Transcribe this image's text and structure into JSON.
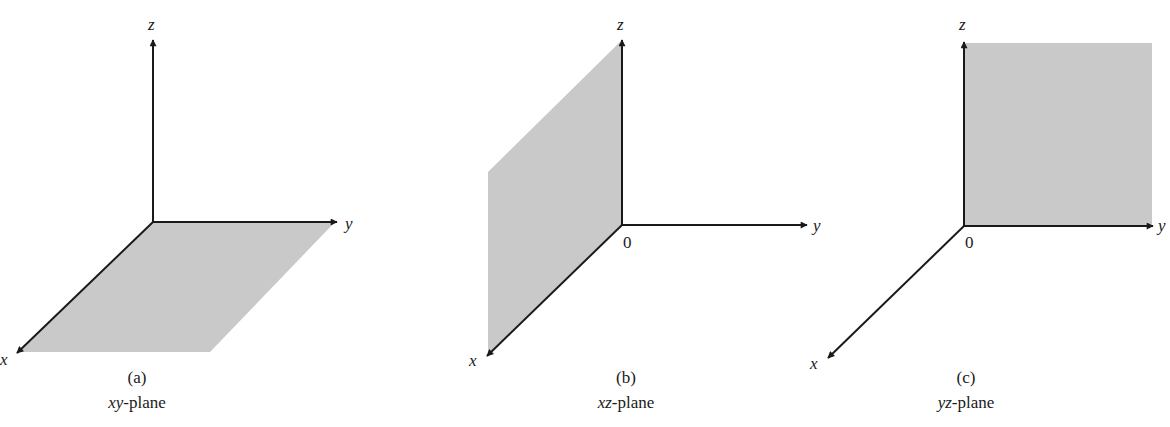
{
  "figure": {
    "colors": {
      "plane_fill": "#c9c9c9",
      "axis": "#1a1a1a",
      "background": "#ffffff"
    },
    "panels": [
      {
        "id": "a",
        "caption_letter": "(a)",
        "caption_var": "xy",
        "caption_suffix": "-plane",
        "axes": {
          "x": "x",
          "y": "y",
          "z": "z"
        },
        "origin_label": ""
      },
      {
        "id": "b",
        "caption_letter": "(b)",
        "caption_var": "xz",
        "caption_suffix": "-plane",
        "axes": {
          "x": "x",
          "y": "y",
          "z": "z"
        },
        "origin_label": "0"
      },
      {
        "id": "c",
        "caption_letter": "(c)",
        "caption_var": "yz",
        "caption_suffix": "-plane",
        "axes": {
          "x": "x",
          "y": "y",
          "z": "z"
        },
        "origin_label": "0"
      }
    ]
  }
}
